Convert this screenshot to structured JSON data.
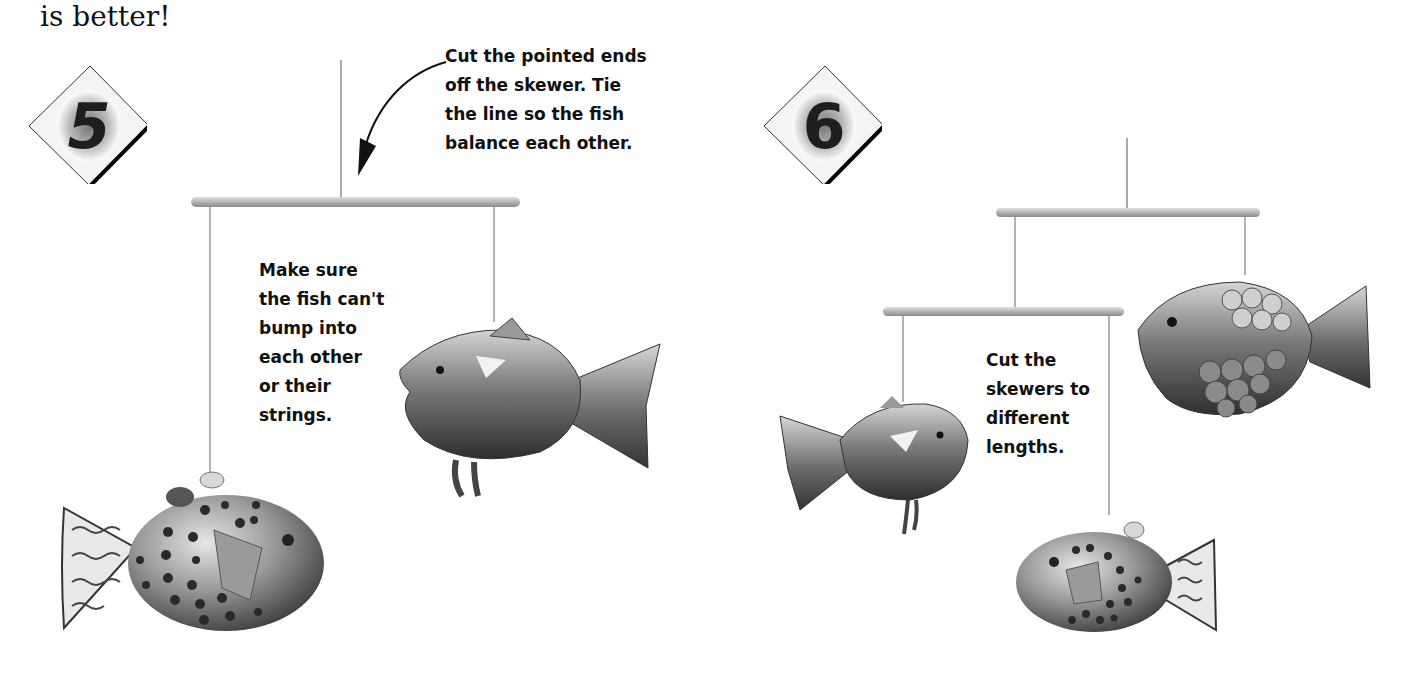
{
  "page": {
    "intro_text": "is better!"
  },
  "steps": [
    {
      "number": "5",
      "captions": [
        {
          "id": "cut-ends",
          "text": "Cut the pointed ends\noff the skewer. Tie\nthe line so the fish\nbalance each other."
        },
        {
          "id": "make-sure",
          "text": "Make sure\nthe fish can't\nbump into\neach other\nor their\nstrings."
        }
      ]
    },
    {
      "number": "6",
      "captions": [
        {
          "id": "skewers",
          "text": "Cut the\nskewers to\ndifferent\nlengths."
        }
      ]
    }
  ],
  "colors": {
    "text": "#111111",
    "skewer": "#b8b8b8",
    "skewer_edge": "#8a8a8a",
    "string": "#6a6a6a",
    "fish_dark": "#3a3a3a",
    "fish_mid": "#8c8c8c",
    "fish_light": "#d8d8d8"
  }
}
